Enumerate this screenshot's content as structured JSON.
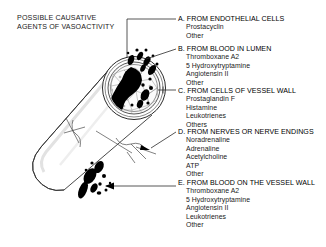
{
  "figure": {
    "title": "POSSIBLE CAUSATIVE\nAGENTS OF VASOACTIVITY",
    "diagram_name": "blood-vessel-cutaway-illustration"
  },
  "legend": [
    {
      "key": "A",
      "heading": "A. FROM ENDOTHELIAL CELLS",
      "items": [
        "Prostacyclin",
        "Other"
      ]
    },
    {
      "key": "B",
      "heading": "B. FROM BLOOD IN LUMEN",
      "items": [
        "Thromboxane A2",
        "5 Hydroxytryptamine",
        "Angiotensin II",
        "Other"
      ]
    },
    {
      "key": "C",
      "heading": "C. FROM CELLS OF VESSEL WALL",
      "items": [
        "Prostaglandin F",
        "Histamine",
        "Leukotrienes",
        "Others"
      ]
    },
    {
      "key": "D",
      "heading": "D. FROM NERVES OR NERVE ENDINGS",
      "items": [
        "Noradrenaline",
        "Adrenaline",
        "Acetylcholine",
        "ATP",
        "Other"
      ]
    },
    {
      "key": "E",
      "heading": "E. FROM BLOOD ON THE VESSEL WALL",
      "items": [
        "Thromboxane A2",
        "5 Hydroxytryptamine",
        "Angiotensin II",
        "Leukotrienes",
        "Other"
      ]
    }
  ],
  "colors": {
    "background": "#ffffff",
    "ink": "#000000",
    "text": "#1a1a1a",
    "leader_line": "#2b2b2b",
    "vessel_outline": "#333333",
    "cell_outline": "#777777",
    "blood_fill": "#000000"
  }
}
